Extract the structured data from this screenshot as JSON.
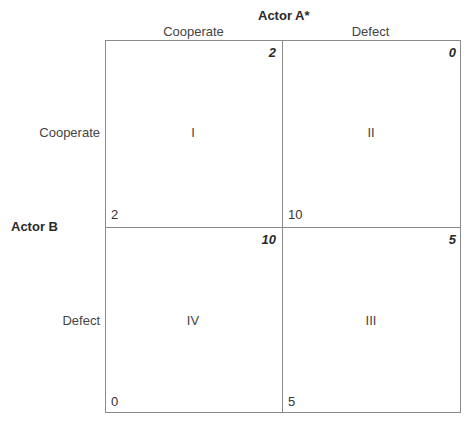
{
  "actor_a": {
    "label": "Actor A*",
    "strategies": [
      "Cooperate",
      "Defect"
    ]
  },
  "actor_b": {
    "label": "Actor B",
    "strategies": [
      "Cooperate",
      "Defect"
    ]
  },
  "cells": {
    "cc": {
      "numeral": "I",
      "payoff_a": "2",
      "payoff_b": "2"
    },
    "cd": {
      "numeral": "II",
      "payoff_a": "0",
      "payoff_b": "10"
    },
    "dc": {
      "numeral": "IV",
      "payoff_a": "10",
      "payoff_b": "0"
    },
    "dd": {
      "numeral": "III",
      "payoff_a": "5",
      "payoff_b": "5"
    }
  }
}
